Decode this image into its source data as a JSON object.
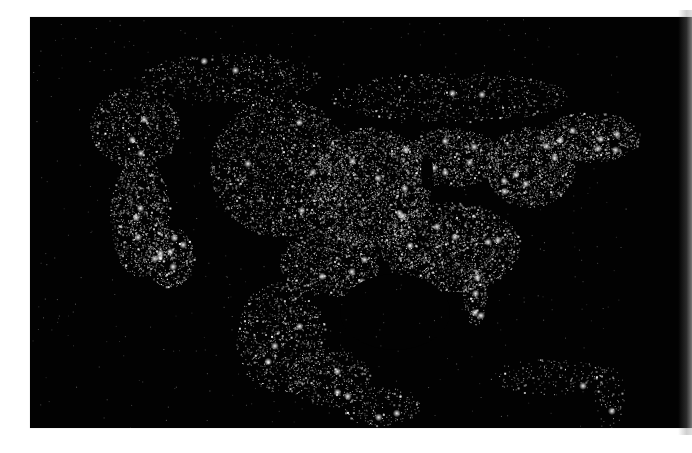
{
  "image": {
    "subject": "North America city lights at night",
    "alt": "Satellite composite of North America at night showing city lights",
    "colors": {
      "background_page": "#ffffff",
      "night": "#020202",
      "light": "#f2f2f2"
    },
    "regions": [
      {
        "name": "pacific-northwest",
        "density": 0.6
      },
      {
        "name": "california-coast",
        "density": 0.9
      },
      {
        "name": "great-plains",
        "density": 0.7
      },
      {
        "name": "midwest",
        "density": 1.0
      },
      {
        "name": "great-lakes",
        "density": 0.9
      },
      {
        "name": "northeast-corridor",
        "density": 1.0
      },
      {
        "name": "southeast",
        "density": 0.95
      },
      {
        "name": "florida",
        "density": 0.8
      },
      {
        "name": "texas",
        "density": 0.8
      },
      {
        "name": "mexico",
        "density": 0.55
      },
      {
        "name": "central-america",
        "density": 0.4
      },
      {
        "name": "caribbean",
        "density": 0.3
      },
      {
        "name": "canada-south",
        "density": 0.35
      }
    ]
  }
}
